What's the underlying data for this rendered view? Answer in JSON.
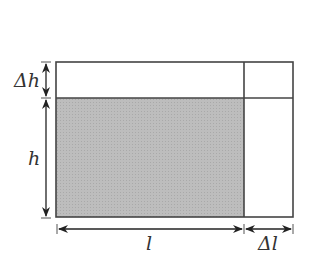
{
  "diagram": {
    "labels": {
      "delta_h": "Δh",
      "h": "h",
      "l": "l",
      "delta_l": "Δl"
    },
    "colors": {
      "shade": "#b9b9b9",
      "stroke": "#444444",
      "background": "#ffffff"
    }
  }
}
